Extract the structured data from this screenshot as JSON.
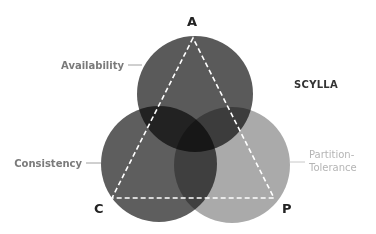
{
  "diagram": {
    "brand": "SCYLLA",
    "vertices": {
      "a": {
        "label": "A",
        "x": 193,
        "y": 38
      },
      "c": {
        "label": "C",
        "x": 112,
        "y": 198
      },
      "p": {
        "label": "P",
        "x": 274,
        "y": 198
      }
    },
    "circles": [
      {
        "id": "availability",
        "cx": 195,
        "cy": 94,
        "r": 58,
        "color": "#5a5a5a"
      },
      {
        "id": "consistency",
        "cx": 159,
        "cy": 164,
        "r": 58,
        "color": "#5e5e5e"
      },
      {
        "id": "partition-tolerance",
        "cx": 232,
        "cy": 165,
        "r": 58,
        "color": "#9c9c9c"
      }
    ],
    "labels": {
      "availability": "Availability",
      "consistency": "Consistency",
      "partition_line1": "Partition-",
      "partition_line2": "Tolerance"
    },
    "colors": {
      "triangle_stroke": "#ffffff",
      "leader_line": "#a0a0a0"
    }
  }
}
